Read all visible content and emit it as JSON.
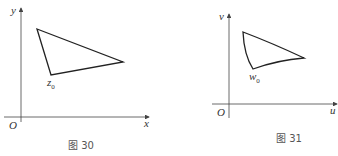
{
  "figures": [
    {
      "caption": "图 30",
      "axes": {
        "x_label": "x",
        "y_label": "y",
        "origin_label": "O"
      },
      "point_label": {
        "base": "z",
        "sub": "0"
      },
      "shape": "triangle (straight edges)",
      "vertices": [
        [
          37,
          29
        ],
        [
          123,
          62
        ],
        [
          51,
          75
        ]
      ]
    },
    {
      "caption": "图 31",
      "axes": {
        "x_label": "u",
        "y_label": "v",
        "origin_label": "O"
      },
      "point_label": {
        "base": "w",
        "sub": "0"
      },
      "shape": "curvilinear triangle (image of fig.30 triangle)",
      "vertices": [
        [
          243,
          32
        ],
        [
          304,
          58
        ],
        [
          253,
          69
        ]
      ]
    }
  ],
  "colors": {
    "stroke": "#222222",
    "axis": "#444444",
    "text": "#333333"
  }
}
